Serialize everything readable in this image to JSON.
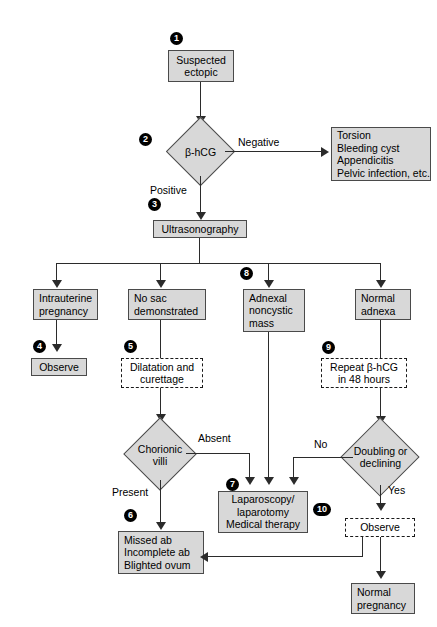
{
  "diagram": {
    "type": "clinical-flowchart",
    "colors": {
      "node_fill": "#d8d8d8",
      "node_shadow": "#8e8e8e",
      "node_border": "#4a4a4a",
      "line": "#2b2b2b",
      "badge_fill": "#000000",
      "badge_text": "#ffffff",
      "background": "#ffffff"
    }
  },
  "nodes": {
    "suspected_ectopic": "Suspected\nectopic",
    "bhcg": "β-hCG",
    "negative_causes": "Torsion\nBleeding cyst\nAppendicitis\nPelvic infection, etc.",
    "ultrasonography": "Ultrasonography",
    "intrauterine_pregnancy": "Intrauterine\npregnancy",
    "no_sac": "No sac\ndemonstrated",
    "adnexal_mass": "Adnexal\nnoncystic\nmass",
    "normal_adnexa": "Normal\nadnexa",
    "observe_4": "Observe",
    "dilatation_curettage": "Dilatation and\ncurettage",
    "chorionic_villi": "Chorionic\nvilli",
    "missed_ab": "Missed ab\nIncomplete ab\nBlighted ovum",
    "laparoscopy": "Laparoscopy/\nlaparotomy\nMedical therapy",
    "repeat_bhcg": "Repeat β-hCG\nin 48 hours",
    "doubling_declining": "Doubling or\ndeclining",
    "observe_10": "Observe",
    "normal_pregnancy": "Normal\npregnancy"
  },
  "badges": {
    "b1": "1",
    "b2": "2",
    "b3": "3",
    "b4": "4",
    "b5": "5",
    "b6": "6",
    "b7": "7",
    "b8": "8",
    "b9": "9",
    "b10": "10"
  },
  "edge_labels": {
    "negative": "Negative",
    "positive": "Positive",
    "absent": "Absent",
    "present": "Present",
    "no": "No",
    "yes": "Yes"
  }
}
